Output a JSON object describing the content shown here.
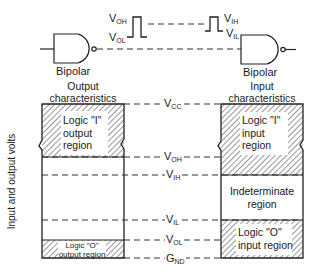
{
  "diagram": {
    "top": {
      "left_gate_label": "Bipolar",
      "right_gate_label": "Bipolar",
      "output_pulse": {
        "high": "V",
        "high_sub": "OH",
        "low": "V",
        "low_sub": "OL"
      },
      "input_pulse": {
        "high": "V",
        "high_sub": "IH",
        "low": "V",
        "low_sub": "IL"
      }
    },
    "left_column": {
      "heading_line1": "Output",
      "heading_line2": "characteristics",
      "logic1_region": [
        "Logic \"I\"",
        "output",
        "region"
      ],
      "logic0_region": [
        "Logic \"O\"",
        "output region"
      ]
    },
    "right_column": {
      "heading_line1": "Input",
      "heading_line2": "characteristics",
      "logic1_region": [
        "Logic \"I\"",
        "input",
        "region"
      ],
      "indeterminate_region": [
        "Indeterminate",
        "region"
      ],
      "logic0_region": [
        "Logic \"O\"",
        "input region"
      ]
    },
    "levels": [
      {
        "name": "V",
        "sub": "CC",
        "y": 104
      },
      {
        "name": "V",
        "sub": "OH",
        "y": 157
      },
      {
        "name": "V",
        "sub": "IH",
        "y": 175
      },
      {
        "name": "V",
        "sub": "IL",
        "y": 220
      },
      {
        "name": "V",
        "sub": "OL",
        "y": 240
      },
      {
        "name": "G",
        "sub": "ND",
        "y": 258
      }
    ],
    "y_axis_label": "Input and output volts"
  }
}
